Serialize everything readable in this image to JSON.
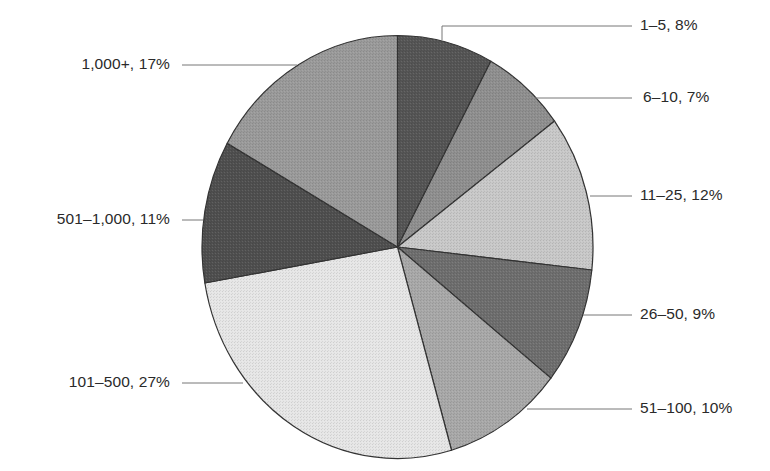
{
  "chart_data": {
    "type": "pie",
    "title": "",
    "start_angle_deg": 0,
    "direction": "clockwise",
    "categories": [
      "1–5",
      "6–10",
      "11–25",
      "26–50",
      "51–100",
      "101–500",
      "501–1,000",
      "1,000+"
    ],
    "values": [
      8,
      7,
      12,
      9,
      10,
      27,
      11,
      17
    ],
    "unit": "%",
    "labels": [
      "1–5, 8%",
      "6–10, 7%",
      "11–25, 12%",
      "26–50, 9%",
      "51–100, 10%",
      "101–500, 27%",
      "501–1,000, 11%",
      "1,000+, 17%"
    ],
    "colors": [
      "#555555",
      "#8f8f8f",
      "#c8c8c8",
      "#6e6e6e",
      "#a8a8a8",
      "#e6e6e6",
      "#4f4f4f",
      "#9a9a9a"
    ],
    "legend": "none (callout labels with leader lines)"
  },
  "geometry": {
    "cx": 397.5,
    "cy": 247,
    "rx": 195.5,
    "ry": 211.5,
    "outline_color": "#333333",
    "leader_color": "#777777"
  },
  "callouts": [
    {
      "side": "right",
      "label_y": 26,
      "anchor": [
        442,
        40
      ],
      "elbow": [
        442,
        26
      ],
      "end_x": 632,
      "text_x": 640
    },
    {
      "side": "right",
      "label_y": 98,
      "anchor": [
        535,
        98
      ],
      "end_x": 632,
      "text_x": 643
    },
    {
      "side": "right",
      "label_y": 196,
      "anchor": [
        590,
        196
      ],
      "end_x": 632,
      "text_x": 640
    },
    {
      "side": "right",
      "label_y": 315,
      "anchor": [
        583,
        315
      ],
      "end_x": 632,
      "text_x": 640
    },
    {
      "side": "right",
      "label_y": 409,
      "anchor": [
        527,
        409
      ],
      "end_x": 632,
      "text_x": 640
    },
    {
      "side": "left",
      "label_y": 383,
      "anchor": [
        243,
        383
      ],
      "end_x": 182,
      "text_right": 170
    },
    {
      "side": "left",
      "label_y": 220,
      "anchor": [
        203,
        220
      ],
      "end_x": 182,
      "text_right": 170
    },
    {
      "side": "left",
      "label_y": 65,
      "anchor": [
        297,
        65
      ],
      "end_x": 182,
      "text_right": 170
    }
  ]
}
